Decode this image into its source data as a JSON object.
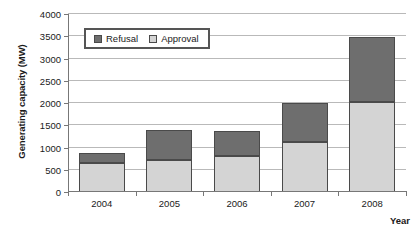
{
  "chart_data": {
    "type": "bar",
    "stacked": true,
    "title": "",
    "xlabel": "Year",
    "ylabel": "Generating capacity (MW)",
    "categories": [
      "2004",
      "2005",
      "2006",
      "2007",
      "2008"
    ],
    "series": [
      {
        "name": "Approval",
        "color": "#d4d4d4",
        "values": [
          650,
          720,
          800,
          1120,
          2030
        ]
      },
      {
        "name": "Refusal",
        "color": "#6e6e6e",
        "values": [
          230,
          670,
          580,
          880,
          1450
        ]
      }
    ],
    "stack_order": [
      "Approval",
      "Refusal"
    ],
    "totals": [
      880,
      1390,
      1380,
      2000,
      3480
    ],
    "ylim": [
      0,
      4000
    ],
    "ytick_step": 500,
    "yticks": [
      0,
      500,
      1000,
      1500,
      2000,
      2500,
      3000,
      3500,
      4000
    ],
    "ytick_labels": [
      "0",
      "500",
      "1000",
      "1500",
      "2000",
      "2500",
      "3000",
      "3500",
      "4000"
    ],
    "grid": "horizontal",
    "legend_position": "top-left-inside",
    "legend_entries": [
      "Refusal",
      "Approval"
    ]
  },
  "colors": {
    "refusal": "#6e6e6e",
    "approval": "#d4d4d4",
    "gridline": "#b9b9b9",
    "axis": "#777777",
    "bar_outline": "#4a4a4a",
    "background": "#ffffff"
  }
}
